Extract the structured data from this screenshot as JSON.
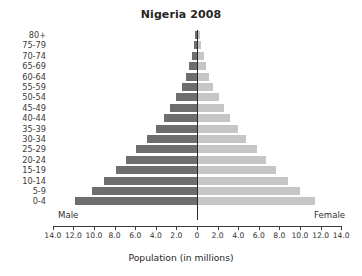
{
  "chart_data": {
    "type": "bar",
    "subtype": "population-pyramid",
    "title": "Nigeria 2008",
    "xlabel": "Population (in millions)",
    "ylabel": "",
    "grid": false,
    "legend_position": "inline-sides",
    "axis_ticks": [
      "14.0",
      "12.0",
      "10.0",
      "8.0",
      "6.0",
      "4.0",
      "2.0",
      "0",
      "2.0",
      "4.0",
      "6.0",
      "8.0",
      "10.0",
      "12.0",
      "14.0"
    ],
    "tick_values": [
      -14,
      -12,
      -10,
      -8,
      -6,
      -4,
      -2,
      0,
      2,
      4,
      6,
      8,
      10,
      12,
      14
    ],
    "xlim": [
      -14,
      14
    ],
    "categories": [
      "0-4",
      "5-9",
      "10-14",
      "15-19",
      "20-24",
      "25-29",
      "30-34",
      "35-39",
      "40-44",
      "45-49",
      "50-54",
      "55-59",
      "60-64",
      "65-69",
      "70-74",
      "75-79",
      "80+"
    ],
    "series": [
      {
        "name": "Male",
        "side": "left",
        "color": "#6e6e6e",
        "values": [
          11.8,
          10.2,
          9.0,
          7.9,
          6.9,
          5.9,
          4.9,
          4.0,
          3.2,
          2.6,
          2.0,
          1.5,
          1.1,
          0.75,
          0.5,
          0.3,
          0.2
        ]
      },
      {
        "name": "Female",
        "side": "right",
        "color": "#c6c6c6",
        "values": [
          11.4,
          9.9,
          8.7,
          7.6,
          6.6,
          5.7,
          4.7,
          3.9,
          3.1,
          2.5,
          2.0,
          1.5,
          1.1,
          0.8,
          0.55,
          0.3,
          0.2
        ]
      }
    ],
    "annotations": [
      {
        "name": "male-label",
        "text": "Male"
      },
      {
        "name": "female-label",
        "text": "Female"
      }
    ]
  }
}
